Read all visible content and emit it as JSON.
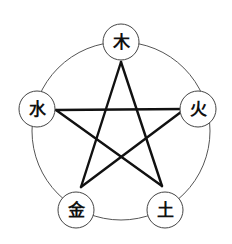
{
  "diagram": {
    "outer_circle": {
      "cx": 121,
      "cy": 131,
      "r": 89,
      "stroke": "#555555"
    },
    "nodes": [
      {
        "id": "wood",
        "label": "木",
        "cx": 121,
        "cy": 42,
        "r": 18
      },
      {
        "id": "fire",
        "label": "火",
        "cx": 198,
        "cy": 109,
        "r": 18
      },
      {
        "id": "earth",
        "label": "土",
        "cx": 165,
        "cy": 210,
        "r": 18
      },
      {
        "id": "metal",
        "label": "金",
        "cx": 76,
        "cy": 210,
        "r": 18
      },
      {
        "id": "water",
        "label": "水",
        "cx": 37,
        "cy": 109,
        "r": 18
      }
    ],
    "star_color": "#111111"
  }
}
